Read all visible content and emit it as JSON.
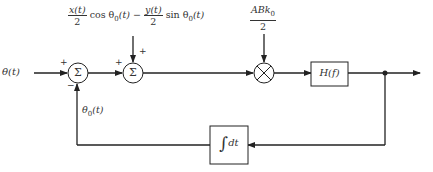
{
  "diagram": {
    "type": "block-diagram",
    "input": {
      "label": "θ(t)"
    },
    "noise_input": {
      "term1_num": "x(t)",
      "term1_den": "2",
      "term1_fn": "cos θ",
      "sub": "0",
      "arg": "(t)",
      "minus": "−",
      "term2_num": "y(t)",
      "term2_den": "2",
      "term2_fn": "sin θ"
    },
    "gain_input": {
      "num": "ABk",
      "sub": "0",
      "den": "2"
    },
    "summer1": {
      "symbol": "Σ",
      "sign_top_left": "+",
      "sign_bottom": "−"
    },
    "summer2": {
      "symbol": "Σ",
      "sign_left": "+",
      "sign_top": "+"
    },
    "multiplier": {
      "symbol": "⊗"
    },
    "filter": {
      "label": "H(f)"
    },
    "integrator": {
      "symbol": "∫",
      "label": "dt"
    },
    "feedback": {
      "label_base": "θ",
      "label_sub": "0",
      "label_arg": "(t)"
    },
    "colors": {
      "line": "#222222",
      "background": "#ffffff"
    }
  }
}
